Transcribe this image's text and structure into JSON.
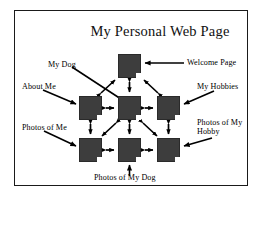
{
  "diagram": {
    "title": "My Personal Web Page",
    "frame": {
      "border_color": "#1a1a1a"
    },
    "node_color": "#3d3d3d",
    "nodes": [
      {
        "id": "welcome",
        "label": "Welcome Page",
        "x": 118,
        "y": 54,
        "w": 23,
        "h": 24
      },
      {
        "id": "about-me",
        "label": "About Me",
        "x": 79,
        "y": 96,
        "w": 23,
        "h": 24
      },
      {
        "id": "my-dog",
        "label": "My Dog",
        "x": 118,
        "y": 96,
        "w": 23,
        "h": 24
      },
      {
        "id": "my-hobbies",
        "label": "My Hobbies",
        "x": 157,
        "y": 96,
        "w": 23,
        "h": 24
      },
      {
        "id": "photos-of-me",
        "label": "Photos of Me",
        "x": 79,
        "y": 138,
        "w": 23,
        "h": 24
      },
      {
        "id": "photos-of-dog",
        "label": "Photos of My Dog",
        "x": 118,
        "y": 138,
        "w": 23,
        "h": 24
      },
      {
        "id": "photos-hobby",
        "label": "Photos of My Hobby",
        "x": 157,
        "y": 138,
        "w": 23,
        "h": 24
      }
    ],
    "callouts": [
      {
        "id": "my-dog",
        "text": "My Dog",
        "x": 48,
        "y": 60,
        "align": "left"
      },
      {
        "id": "welcome",
        "text": "Welcome Page",
        "x": 186,
        "y": 60,
        "align": "left"
      },
      {
        "id": "about-me",
        "text": "About Me",
        "x": 22,
        "y": 86,
        "align": "left"
      },
      {
        "id": "my-hobbies",
        "text": "My Hobbies",
        "x": 196,
        "y": 86,
        "align": "left"
      },
      {
        "id": "photos-of-me",
        "text": "Photos of Me",
        "x": 22,
        "y": 126,
        "align": "left"
      },
      {
        "id": "photos-hobby",
        "text": "Photos of My Hobby",
        "x": 198,
        "y": 120,
        "align": "left",
        "wrap": true
      },
      {
        "id": "photos-of-dog",
        "text": "Photos of My Dog",
        "x": 94,
        "y": 178,
        "align": "left"
      }
    ],
    "links": [
      {
        "from": "welcome",
        "to": "my-dog",
        "kind": "double",
        "orientation": "vertical"
      },
      {
        "from": "about-me",
        "to": "my-dog",
        "kind": "double",
        "orientation": "horizontal"
      },
      {
        "from": "my-dog",
        "to": "my-hobbies",
        "kind": "double",
        "orientation": "horizontal"
      },
      {
        "from": "about-me",
        "to": "photos-of-me",
        "kind": "double",
        "orientation": "vertical"
      },
      {
        "from": "my-dog",
        "to": "photos-of-dog",
        "kind": "double",
        "orientation": "vertical"
      },
      {
        "from": "my-hobbies",
        "to": "photos-hobby",
        "kind": "double",
        "orientation": "vertical"
      },
      {
        "from": "photos-of-me",
        "to": "photos-of-dog",
        "kind": "double",
        "orientation": "horizontal"
      },
      {
        "from": "photos-of-dog",
        "to": "photos-hobby",
        "kind": "double",
        "orientation": "horizontal"
      },
      {
        "from": "about-me",
        "to": "welcome",
        "kind": "double",
        "orientation": "diagonal"
      },
      {
        "from": "my-hobbies",
        "to": "welcome",
        "kind": "double",
        "orientation": "diagonal"
      },
      {
        "from": "my-dog",
        "to": "photos-of-me",
        "kind": "double",
        "orientation": "diagonal"
      },
      {
        "from": "my-dog",
        "to": "photos-hobby",
        "kind": "double",
        "orientation": "diagonal"
      }
    ]
  }
}
